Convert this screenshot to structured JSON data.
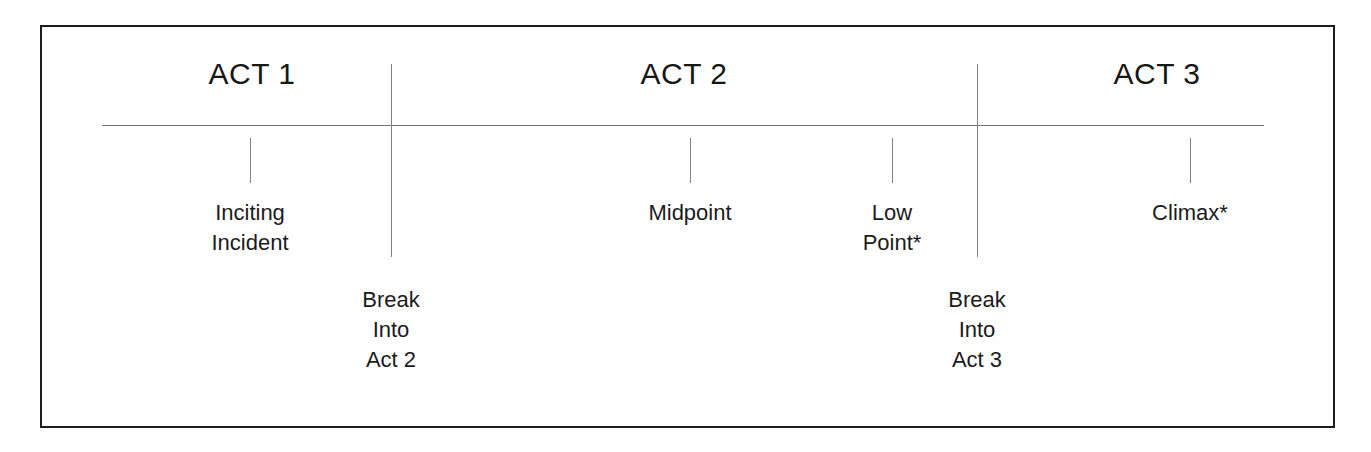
{
  "diagram": {
    "frame": {
      "border_color": "#1c1c1c",
      "background": "#ffffff"
    },
    "axis": {
      "color": "#6f7478",
      "label": "story-timeline"
    },
    "acts": [
      {
        "id": "act-1",
        "label": "ACT 1",
        "center_x": 250
      },
      {
        "id": "act-2",
        "label": "ACT 2",
        "center_x": 682
      },
      {
        "id": "act-3",
        "label": "ACT 3",
        "center_x": 1155
      }
    ],
    "dividers": [
      {
        "id": "divider-act1-act2",
        "x": 389
      },
      {
        "id": "divider-act2-act3",
        "x": 975
      }
    ],
    "beats": [
      {
        "id": "inciting-incident",
        "lines": [
          "Inciting",
          "Incident"
        ],
        "tick_x": 248,
        "label_x": 248,
        "label_top": 196,
        "has_tick": true
      },
      {
        "id": "break-into-act-2",
        "lines": [
          "Break",
          "Into",
          "Act 2"
        ],
        "tick_x": 389,
        "label_x": 389,
        "label_top": 283,
        "has_tick": false
      },
      {
        "id": "midpoint",
        "lines": [
          "Midpoint"
        ],
        "tick_x": 688,
        "label_x": 688,
        "label_top": 196,
        "has_tick": true
      },
      {
        "id": "low-point",
        "lines": [
          "Low",
          "Point*"
        ],
        "tick_x": 890,
        "label_x": 890,
        "label_top": 196,
        "has_tick": true
      },
      {
        "id": "break-into-act-3",
        "lines": [
          "Break",
          "Into",
          "Act 3"
        ],
        "tick_x": 975,
        "label_x": 975,
        "label_top": 283,
        "has_tick": false
      },
      {
        "id": "climax",
        "lines": [
          "Climax*"
        ],
        "tick_x": 1188,
        "label_x": 1188,
        "label_top": 196,
        "has_tick": true
      }
    ]
  }
}
